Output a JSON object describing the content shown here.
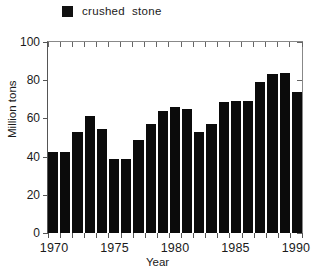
{
  "legend": {
    "marker": "filled-square",
    "label": "crushed  stone",
    "color": "#0b0b0b"
  },
  "axes": {
    "y_title": "Million tons",
    "x_title": "Year",
    "y_ticks": [
      "0",
      "20",
      "40",
      "60",
      "80",
      "100"
    ],
    "x_ticks": [
      "1970",
      "1975",
      "1980",
      "1985",
      "1990"
    ]
  },
  "chart_data": {
    "type": "bar",
    "title": "",
    "subtitle": "",
    "xlabel": "Year",
    "ylabel": "Million tons",
    "series_name": "crushed stone",
    "bar_color": "#0b0b0b",
    "grid": false,
    "legend_position": "top",
    "xlim": [
      1969.5,
      1990.5
    ],
    "ylim": [
      0,
      100
    ],
    "ytick_values": [
      0,
      20,
      40,
      60,
      80,
      100
    ],
    "xtick_values": [
      1970,
      1975,
      1980,
      1985,
      1990
    ],
    "x_minor_tick_interval": 1,
    "categories": [
      "1970",
      "1971",
      "1972",
      "1973",
      "1974",
      "1975",
      "1976",
      "1977",
      "1978",
      "1979",
      "1980",
      "1981",
      "1982",
      "1983",
      "1984",
      "1985",
      "1986",
      "1987",
      "1988",
      "1989",
      "1990"
    ],
    "values": [
      42.5,
      42.5,
      53,
      61.5,
      54.5,
      39,
      38.5,
      48.5,
      57,
      64,
      66,
      65,
      53,
      57,
      68.5,
      69,
      69,
      79,
      83,
      84,
      74
    ],
    "units": "Million tons"
  }
}
